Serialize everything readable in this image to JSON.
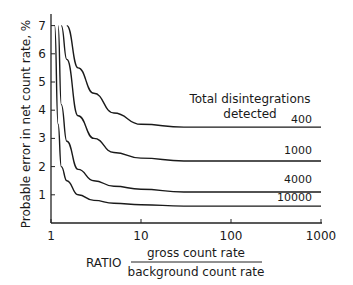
{
  "chart_data": {
    "type": "line",
    "title": "",
    "xlabel": "RATIO gross count rate / background count rate",
    "xlabel_prefix": "RATIO",
    "xlabel_numerator": "gross count rate",
    "xlabel_denominator": "background count rate",
    "ylabel": "Probable error in net count rate, %",
    "xscale": "log",
    "xlim": [
      1,
      1000
    ],
    "ylim": [
      0,
      7
    ],
    "x_ticks": [
      "1",
      "10",
      "100",
      "1000"
    ],
    "y_ticks": [
      "1",
      "2",
      "3",
      "4",
      "5",
      "6",
      "7"
    ],
    "grid": false,
    "legend_title": "Total disintegrations detected",
    "legend_title_line1": "Total disintegrations",
    "legend_title_line2": "detected",
    "x": [
      1.1,
      1.2,
      1.3,
      1.5,
      2,
      3,
      5,
      10,
      30,
      100,
      1000
    ],
    "series": [
      {
        "name": "400",
        "values": [
          null,
          null,
          null,
          7.0,
          5.5,
          4.6,
          3.9,
          3.5,
          3.4,
          3.4,
          3.4
        ]
      },
      {
        "name": "1000",
        "values": [
          null,
          null,
          7.0,
          5.8,
          3.8,
          3.0,
          2.5,
          2.3,
          2.2,
          2.2,
          2.2
        ]
      },
      {
        "name": "4000",
        "values": [
          null,
          7.0,
          4.2,
          2.9,
          1.9,
          1.5,
          1.3,
          1.2,
          1.1,
          1.1,
          1.1
        ]
      },
      {
        "name": "10000",
        "values": [
          7.0,
          3.5,
          2.0,
          1.5,
          1.0,
          0.8,
          0.7,
          0.65,
          0.6,
          0.6,
          0.6
        ]
      }
    ]
  }
}
